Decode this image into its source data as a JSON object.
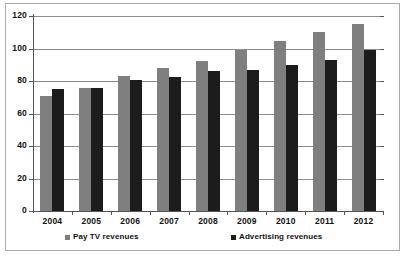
{
  "chart_data": {
    "type": "bar",
    "title": "",
    "subtitle": "",
    "xlabel": "",
    "ylabel": "",
    "categories": [
      "2004",
      "2005",
      "2006",
      "2007",
      "2008",
      "2009",
      "2010",
      "2011",
      "2012"
    ],
    "series": [
      {
        "name": "Pay TV revenues",
        "color": "#7f7f7f",
        "values": [
          71,
          76,
          83,
          88,
          92.5,
          99,
          104.5,
          110,
          115
        ]
      },
      {
        "name": "Advertising revenues",
        "color": "#1c1c1c",
        "values": [
          75,
          76,
          80.5,
          82.5,
          86,
          86.5,
          90,
          93,
          99
        ]
      }
    ],
    "ylim": [
      0,
      120
    ],
    "yticks": [
      0,
      20,
      40,
      60,
      80,
      100,
      120
    ],
    "ytick_labels": [
      "0",
      "20",
      "40",
      "60",
      "80",
      "100",
      "120"
    ],
    "grid": true,
    "grid_axis": "y",
    "legend_position": "bottom",
    "annotations": []
  },
  "legend": {
    "items": [
      {
        "label": "Pay TV revenues",
        "marker": "square-marker-gray"
      },
      {
        "label": "Advertising revenues",
        "marker": "square-marker-black"
      }
    ]
  }
}
